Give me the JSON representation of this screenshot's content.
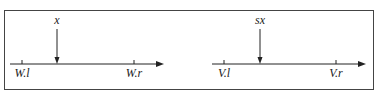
{
  "diagram": {
    "frame": {
      "x": 4,
      "y": 10,
      "width": 369,
      "height": 79
    },
    "panels": [
      {
        "name": "left",
        "axis": {
          "x1": 10,
          "x2": 162,
          "y": 64
        },
        "pointer": {
          "x": 57,
          "label": "x"
        },
        "ticks": [
          {
            "x": 22,
            "label": "W.l"
          },
          {
            "x": 134,
            "label": "W.r"
          }
        ]
      },
      {
        "name": "right",
        "axis": {
          "x1": 212,
          "x2": 364,
          "y": 64
        },
        "pointer": {
          "x": 260,
          "label": "sx"
        },
        "ticks": [
          {
            "x": 224,
            "label": "V.l"
          },
          {
            "x": 336,
            "label": "V.r"
          }
        ]
      }
    ],
    "colors": {
      "line": "#222222",
      "frame": "#444444"
    }
  }
}
